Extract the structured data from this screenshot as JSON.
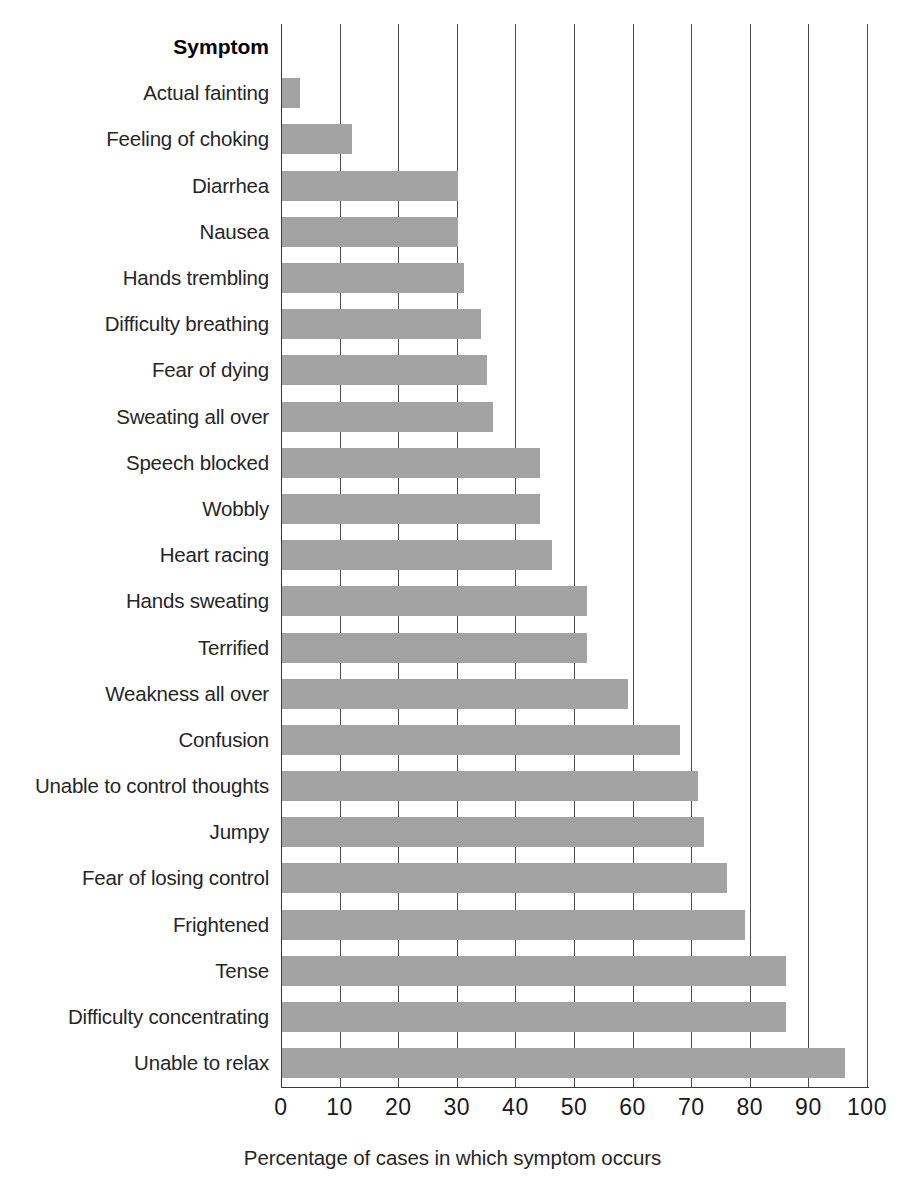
{
  "chart_data": {
    "type": "bar",
    "orientation": "horizontal",
    "title": "",
    "xlabel": "Percentage of cases in which symptom occurs",
    "ylabel": "Symptom",
    "xlim": [
      0,
      100
    ],
    "xticks": [
      0,
      10,
      20,
      30,
      40,
      50,
      60,
      70,
      80,
      90,
      100
    ],
    "xtick_labels": [
      "0",
      "10",
      "20",
      "30",
      "40",
      "50",
      "60",
      "70",
      "80",
      "90",
      "100"
    ],
    "grid": "vertical",
    "legend": null,
    "bar_color": "#a3a3a3",
    "categories": [
      "Actual fainting",
      "Feeling of choking",
      "Diarrhea",
      "Nausea",
      "Hands trembling",
      "Difficulty breathing",
      "Fear of dying",
      "Sweating all over",
      "Speech blocked",
      "Wobbly",
      "Heart racing",
      "Hands sweating",
      "Terrified",
      "Weakness all over",
      "Confusion",
      "Unable to control thoughts",
      "Jumpy",
      "Fear of losing control",
      "Frightened",
      "Tense",
      "Difficulty concentrating",
      "Unable to relax"
    ],
    "values": [
      3,
      12,
      30,
      30,
      31,
      34,
      35,
      36,
      44,
      44,
      46,
      52,
      52,
      59,
      68,
      71,
      72,
      76,
      79,
      86,
      86,
      96
    ]
  },
  "axis": {
    "header_label": "Symptom",
    "x_axis_title": "Percentage of cases in which symptom occurs"
  }
}
